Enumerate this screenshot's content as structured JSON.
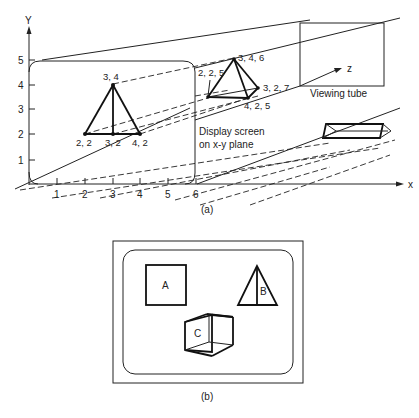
{
  "figure_a": {
    "caption": "(a)",
    "axes": {
      "y_label": "Y",
      "x_label": "x",
      "z_label": "z",
      "y_ticks": [
        "1",
        "2",
        "3",
        "4",
        "5"
      ],
      "x_ticks": [
        "1",
        "2",
        "3",
        "4",
        "5",
        "6"
      ]
    },
    "display_screen_label": [
      "Display screen",
      "on x-y plane"
    ],
    "viewing_tube_label": "Viewing tube",
    "triangle_2d_points": {
      "top": "3, 4",
      "left": "2, 2",
      "mid": "3, 2",
      "right": "4, 2"
    },
    "pyramid_3d_points": {
      "apex": "3, 4, 6",
      "left": "2, 2, 5",
      "right": "3, 2, 7",
      "front": "4, 2, 5"
    }
  },
  "figure_b": {
    "caption": "(b)",
    "shapes": {
      "square": "A",
      "triangle": "B",
      "cube": "C"
    }
  }
}
